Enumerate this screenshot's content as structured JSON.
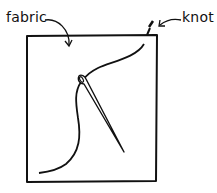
{
  "diagram": {
    "labels": {
      "fabric": "fabric",
      "knot": "knot"
    },
    "elements": [
      {
        "name": "fabric-square",
        "type": "rectangle"
      },
      {
        "name": "thread",
        "type": "curve"
      },
      {
        "name": "needle",
        "type": "needle"
      },
      {
        "name": "knot",
        "type": "knot"
      }
    ],
    "colors": {
      "ink": "#111111",
      "background": "#ffffff"
    }
  }
}
